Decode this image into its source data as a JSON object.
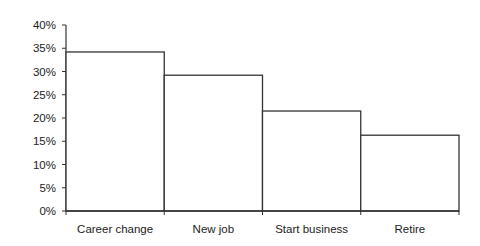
{
  "chart_data": {
    "type": "bar",
    "title": "",
    "xlabel": "",
    "ylabel": "",
    "categories": [
      "Career change",
      "New job",
      "Start business",
      "Retire"
    ],
    "values": [
      34.2,
      29.2,
      21.5,
      16.3
    ],
    "value_format": "percent",
    "ylim": [
      0,
      40
    ],
    "yticks": [
      0,
      5,
      10,
      15,
      20,
      25,
      30,
      35,
      40
    ],
    "ytick_labels": [
      "0%",
      "5%",
      "10%",
      "15%",
      "20%",
      "25%",
      "30%",
      "35%",
      "40%"
    ],
    "grid": false,
    "legend": null,
    "bar_fill": "#ffffff",
    "bar_stroke": "#333333",
    "bar_gap": 0
  }
}
